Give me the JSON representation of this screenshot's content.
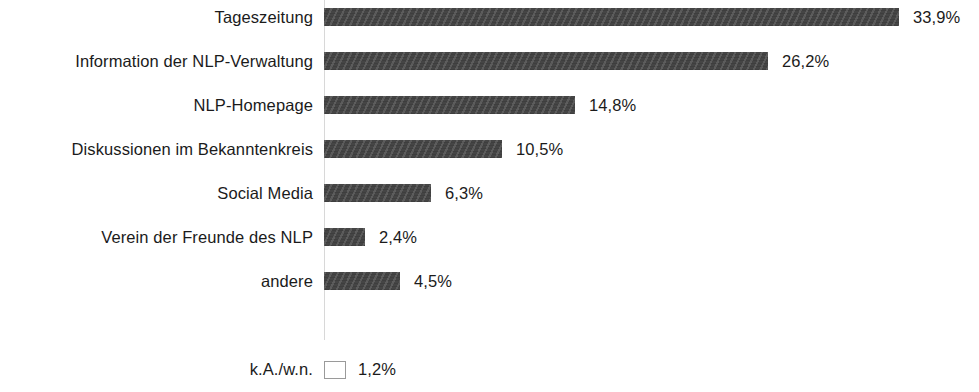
{
  "chart_data": {
    "type": "bar",
    "orientation": "horizontal",
    "title": "",
    "subtitle": "",
    "xlabel": "",
    "ylabel": "",
    "grid": false,
    "legend": null,
    "xlim": [
      0,
      38
    ],
    "value_suffix": "%",
    "decimal_separator": ",",
    "categories": [
      "Tageszeitung",
      "Information der NLP-Verwaltung",
      "NLP-Homepage",
      "Diskussionen im Bekanntenkreis",
      "Social Media",
      "Verein der Freunde des NLP",
      "andere",
      "k.A./w.n."
    ],
    "values": [
      33.9,
      26.2,
      14.8,
      10.5,
      6.3,
      2.4,
      4.5,
      1.2
    ],
    "value_labels": [
      "33,9%",
      "26,2%",
      "14,8%",
      "10,5%",
      "6,3%",
      "2,4%",
      "4,5%",
      "1,2%"
    ],
    "bar_styles": [
      "filled",
      "filled",
      "filled",
      "filled",
      "filled",
      "filled",
      "filled",
      "hollow"
    ],
    "colors": {
      "bar_fill": "#454545",
      "bar_hollow_fill": "#ffffff",
      "bar_hollow_border": "#9a9a9a",
      "text": "#1b1b1b",
      "axis_line": "#d8d8d8",
      "background": "#ffffff"
    }
  },
  "rows": [
    {
      "label": "Tageszeitung",
      "value_label": "33,9%"
    },
    {
      "label": "Information der NLP-Verwaltung",
      "value_label": "26,2%"
    },
    {
      "label": "NLP-Homepage",
      "value_label": "14,8%"
    },
    {
      "label": "Diskussionen im Bekanntenkreis",
      "value_label": "10,5%"
    },
    {
      "label": "Social Media",
      "value_label": "6,3%"
    },
    {
      "label": "Verein der Freunde des NLP",
      "value_label": "2,4%"
    },
    {
      "label": "andere",
      "value_label": "4,5%"
    },
    {
      "label": "k.A./w.n.",
      "value_label": "1,2%"
    }
  ]
}
